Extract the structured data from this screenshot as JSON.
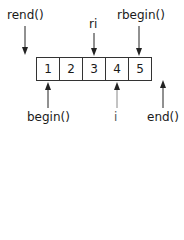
{
  "diagram": {
    "cells": [
      "1",
      "2",
      "3",
      "4",
      "5"
    ],
    "labels": {
      "rend": "rend()",
      "ri": "ri",
      "rbegin": "rbegin()",
      "begin": "begin()",
      "i": "i",
      "end": "end()"
    },
    "colors": {
      "line": "#222222",
      "iterator_i": "#888888"
    }
  }
}
